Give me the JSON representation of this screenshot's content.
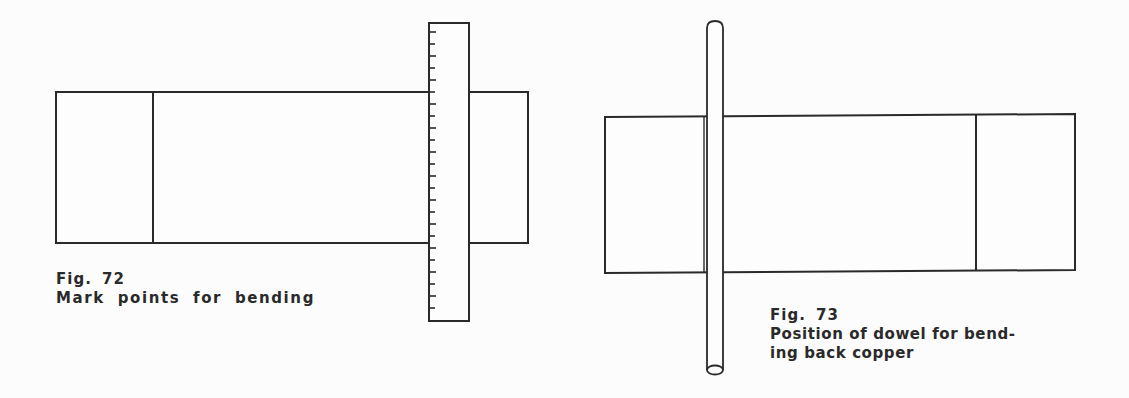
{
  "figures": [
    {
      "number_label": "Fig. 72",
      "caption_lines": [
        "Mark points for bending"
      ],
      "illustration": {
        "description": "Rectangular copper strip with a vertical fold line; a graduated ruler laid across it",
        "strip": {
          "x": 56,
          "y": 92,
          "width": 472,
          "height": 151,
          "fold_lines_x": [
            153
          ]
        },
        "ruler": {
          "x": 428,
          "y": 22,
          "width": 41,
          "height": 299,
          "tick_count": 24,
          "tick_spacing": 12
        }
      }
    },
    {
      "number_label": "Fig. 73",
      "caption_lines": [
        "Position of dowel for bend-",
        "ing back copper"
      ],
      "illustration": {
        "description": "Rectangular copper strip with fold lines; a round dowel placed vertically along the left fold",
        "strip": {
          "x": 605,
          "y": 116,
          "width": 470,
          "height": 156,
          "fold_lines_x": [
            704,
            976
          ]
        },
        "dowel": {
          "x": 707,
          "y": 21,
          "width": 16,
          "height": 353
        }
      }
    }
  ],
  "colors": {
    "ink": "#2a2a2a",
    "paper": "#fcfcfc"
  }
}
